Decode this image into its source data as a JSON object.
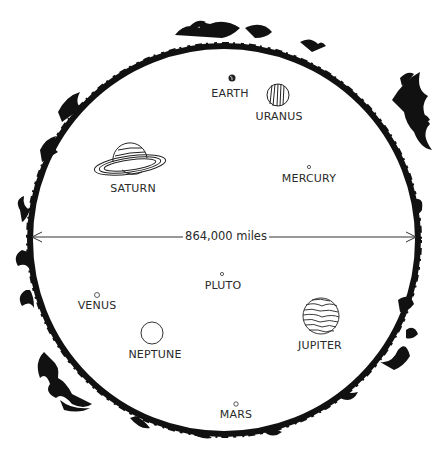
{
  "figure": {
    "diameter_label": "864,000 miles",
    "colors": {
      "ink": "#111111",
      "text": "#2a2a2a",
      "background": "#ffffff"
    }
  },
  "planets": [
    {
      "name": "EARTH",
      "x": 232,
      "y": 78,
      "r": 3.5,
      "label_x": 230,
      "label_y": 88
    },
    {
      "name": "URANUS",
      "x": 278,
      "y": 95,
      "r": 11,
      "label_x": 279,
      "label_y": 111
    },
    {
      "name": "SATURN",
      "x": 130,
      "y": 163,
      "r": 17,
      "label_x": 133,
      "label_y": 183
    },
    {
      "name": "MERCURY",
      "x": 309,
      "y": 167,
      "r": 1.6,
      "label_x": 309,
      "label_y": 173
    },
    {
      "name": "VENUS",
      "x": 97,
      "y": 295,
      "r": 2.5,
      "label_x": 97,
      "label_y": 300
    },
    {
      "name": "PLUTO",
      "x": 222,
      "y": 274,
      "r": 1.6,
      "label_x": 223,
      "label_y": 280
    },
    {
      "name": "NEPTUNE",
      "x": 152,
      "y": 333,
      "r": 11,
      "label_x": 155,
      "label_y": 349
    },
    {
      "name": "JUPITER",
      "x": 321,
      "y": 316,
      "r": 18,
      "label_x": 320,
      "label_y": 340
    },
    {
      "name": "MARS",
      "x": 236,
      "y": 404,
      "r": 2.2,
      "label_x": 236,
      "label_y": 409
    }
  ]
}
